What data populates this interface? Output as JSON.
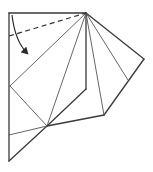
{
  "diagram": {
    "type": "origami-fold-step",
    "colors": {
      "line": "#3a3a3a",
      "crease": "#555555",
      "background": "#ffffff"
    },
    "symbols": {
      "valley_fold_line": "dashed-line",
      "fold_direction": "curved-arrow-icon"
    }
  }
}
